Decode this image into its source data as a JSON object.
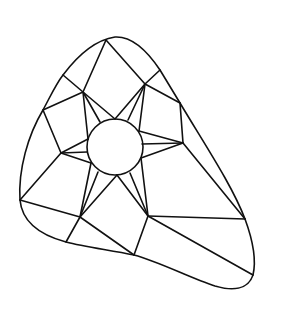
{
  "figure": {
    "stroke_color": "#111111",
    "background_color": "#ffffff",
    "outline_path": "M 115 37 C 132 36, 148 52, 160 70 L 180 103 C 205 145, 232 185, 245 219 C 252 238, 257 258, 253 275 C 248 290, 232 291, 215 286 C 190 278, 160 262, 134 255 C 110 250, 85 247, 66 242 C 40 235, 22 222, 20 200 C 18 170, 28 135, 43 110 C 50 97, 56 84, 63 75 C 78 55, 95 40, 115 37 Z",
    "circle": {
      "cx": 115,
      "cy": 147,
      "r": 28
    },
    "edges": [
      [
        106,
        40,
        83,
        92
      ],
      [
        106,
        40,
        145,
        84
      ],
      [
        63,
        75,
        83,
        92
      ],
      [
        160,
        70,
        145,
        84
      ],
      [
        43,
        110,
        83,
        92
      ],
      [
        43,
        110,
        61,
        153
      ],
      [
        145,
        84,
        180,
        103
      ],
      [
        180,
        103,
        183,
        143
      ],
      [
        183,
        143,
        245,
        219
      ],
      [
        20,
        200,
        61,
        153
      ],
      [
        20,
        200,
        80,
        217
      ],
      [
        80,
        217,
        66,
        242
      ],
      [
        80,
        217,
        134,
        255
      ],
      [
        134,
        255,
        148,
        216
      ],
      [
        148,
        216,
        245,
        219
      ],
      [
        148,
        216,
        253,
        275
      ]
    ],
    "star_points": [
      {
        "name": "top-left",
        "vertex": [
          83,
          92
        ],
        "targets": [
          [
            115,
            119
          ],
          [
            100,
            122
          ],
          [
            88,
            139
          ]
        ]
      },
      {
        "name": "top-right",
        "vertex": [
          145,
          84
        ],
        "targets": [
          [
            115,
            119
          ],
          [
            128,
            120
          ],
          [
            139,
            131
          ]
        ]
      },
      {
        "name": "right",
        "vertex": [
          183,
          143
        ],
        "targets": [
          [
            139,
            131
          ],
          [
            142,
            144
          ],
          [
            141,
            158
          ]
        ]
      },
      {
        "name": "bottom-right",
        "vertex": [
          148,
          216
        ],
        "targets": [
          [
            141,
            158
          ],
          [
            130,
            173
          ],
          [
            117,
            175
          ]
        ]
      },
      {
        "name": "bottom-left",
        "vertex": [
          80,
          217
        ],
        "targets": [
          [
            117,
            175
          ],
          [
            98,
            172
          ],
          [
            91,
            163
          ]
        ]
      },
      {
        "name": "left",
        "vertex": [
          61,
          153
        ],
        "targets": [
          [
            91,
            163
          ],
          [
            87,
            152
          ],
          [
            88,
            139
          ]
        ]
      }
    ]
  }
}
